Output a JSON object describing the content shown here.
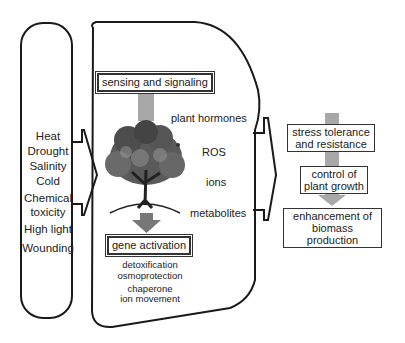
{
  "stresses": [
    "Heat",
    "Drought",
    "Salinity",
    "Cold",
    "Chemical toxicity",
    "High light",
    "Wounding"
  ],
  "center": {
    "top_box": "sensing and signaling",
    "signals": [
      "plant hormones",
      "ROS",
      "ions",
      "metabolites"
    ],
    "bottom_box": "gene activation",
    "responses": [
      "detoxification",
      "osmoprotection",
      "chaperone",
      "ion movement"
    ]
  },
  "outcomes": [
    {
      "line1": "stress tolerance",
      "line2": "and resistance"
    },
    {
      "line1": "control of",
      "line2": "plant growth"
    },
    {
      "line1": "enhancement of",
      "line2": "biomass production"
    }
  ],
  "colors": {
    "line": "#1a1a1a",
    "arrow": "#9a9a9a",
    "arrow_dark": "#6e6e6e",
    "tree": "#4a4a4a"
  }
}
